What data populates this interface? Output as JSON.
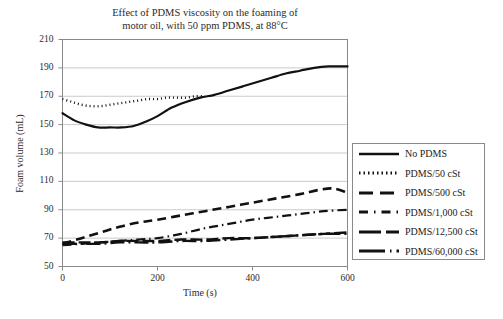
{
  "chart_data": {
    "type": "line",
    "title": "Effect of PDMS viscosity on the foaming of motor oil, with 50 ppm PDMS, at 88°C",
    "title_lines": [
      "Effect of PDMS viscosity on the foaming of",
      "motor oil, with 50 ppm PDMS, at 88°C"
    ],
    "xlabel": "Time (s)",
    "ylabel": "Foam volume (mL)",
    "xlim": [
      0,
      600
    ],
    "ylim": [
      50,
      210
    ],
    "xticks": [
      0,
      200,
      400,
      600
    ],
    "yticks": [
      50,
      70,
      90,
      110,
      130,
      150,
      170,
      190,
      210
    ],
    "grid": "horizontal",
    "legend_position": "right-outside",
    "line_color": "#111111",
    "grid_color": "#bcbcbc",
    "axis_color": "#8a8a8a",
    "series": [
      {
        "name": "No PDMS",
        "style": "solid",
        "dash": "none",
        "width": 2.2,
        "x": [
          0,
          25,
          50,
          75,
          100,
          125,
          150,
          175,
          200,
          230,
          260,
          290,
          320,
          350,
          380,
          410,
          440,
          470,
          500,
          530,
          560,
          600
        ],
        "y": [
          158,
          153,
          150,
          148,
          148,
          148,
          149,
          152,
          156,
          162,
          166,
          169,
          171,
          174,
          177,
          180,
          183,
          186,
          188,
          190,
          191,
          191
        ]
      },
      {
        "name": "PDMS/50 cSt",
        "style": "dotted",
        "dash": "1,3",
        "width": 2.4,
        "x": [
          0,
          20,
          40,
          60,
          80,
          100,
          120,
          140,
          160,
          180,
          200,
          220,
          240,
          260,
          280,
          300
        ],
        "y": [
          168,
          166,
          164,
          163,
          163,
          164,
          165,
          166,
          167,
          168,
          168,
          169,
          169,
          169,
          170,
          170
        ]
      },
      {
        "name": "PDMS/500 cSt",
        "style": "dashed",
        "dash": "9,5",
        "width": 2.6,
        "x": [
          0,
          40,
          80,
          120,
          160,
          200,
          250,
          300,
          350,
          400,
          450,
          500,
          540,
          570,
          600
        ],
        "y": [
          66,
          70,
          74,
          78,
          81,
          83,
          86,
          89,
          92,
          95,
          98,
          101,
          104,
          105,
          102
        ]
      },
      {
        "name": "PDMS/1,000 cSt",
        "style": "dash-dot",
        "dash": "9,4,1.5,4",
        "width": 2.2,
        "x": [
          0,
          40,
          80,
          120,
          160,
          200,
          250,
          300,
          350,
          400,
          450,
          500,
          550,
          600
        ],
        "y": [
          65,
          66,
          67,
          68,
          69,
          70,
          73,
          77,
          80,
          83,
          85,
          87,
          89,
          90
        ]
      },
      {
        "name": "PDMS/12,500 cSt",
        "style": "long-dash",
        "dash": "12,4",
        "width": 2.4,
        "x": [
          0,
          40,
          80,
          120,
          160,
          200,
          250,
          300,
          350,
          400,
          450,
          500,
          550,
          600
        ],
        "y": [
          67,
          67,
          67,
          68,
          68,
          68,
          69,
          69,
          70,
          70,
          71,
          72,
          73,
          74
        ]
      },
      {
        "name": "PDMS/60,000 cSt",
        "style": "long-dash-dot",
        "dash": "14,4,2,4",
        "width": 2.4,
        "x": [
          0,
          40,
          80,
          120,
          160,
          200,
          250,
          300,
          350,
          400,
          450,
          500,
          550,
          600
        ],
        "y": [
          66,
          66,
          66,
          67,
          67,
          67,
          68,
          68,
          69,
          70,
          71,
          72,
          73,
          73
        ]
      }
    ]
  },
  "legend": {
    "items": [
      {
        "label": "No PDMS",
        "dash": "none",
        "width": 2.6
      },
      {
        "label": "PDMS/50 cSt",
        "dash": "1.5,3",
        "width": 2.8
      },
      {
        "label": "PDMS/500 cSt",
        "dash": "14,7",
        "width": 3.2
      },
      {
        "label": "PDMS/1,000 cSt",
        "dash": "9,6,1.5,6",
        "width": 2.8
      },
      {
        "label": "PDMS/12,500 cSt",
        "dash": "22,5",
        "width": 2.8
      },
      {
        "label": "PDMS/60,000 cSt",
        "dash": "26,5,1.5,5",
        "width": 2.8
      }
    ]
  }
}
